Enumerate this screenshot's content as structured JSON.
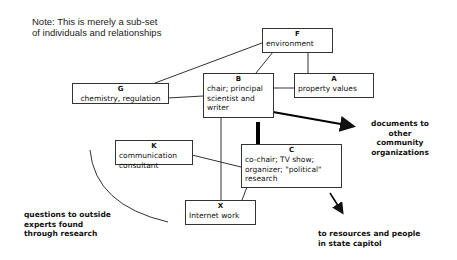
{
  "note": {
    "line1": "Note: This is merely a sub-set",
    "line2": "of individuals and relationships"
  },
  "nodes": {
    "F": {
      "id": "F",
      "lines": [
        "environment"
      ]
    },
    "G": {
      "id": "G",
      "lines": [
        "chemistry, regulation"
      ]
    },
    "B": {
      "id": "B",
      "lines": [
        "chair; principal",
        "scientist and",
        "writer"
      ]
    },
    "A": {
      "id": "A",
      "lines": [
        "property values"
      ]
    },
    "K": {
      "id": "K",
      "lines": [
        "communication",
        "consultant"
      ]
    },
    "C": {
      "id": "C",
      "lines": [
        "co-chair; TV show;",
        "organizer; \"political\"",
        "research"
      ]
    },
    "X": {
      "id": "X",
      "lines": [
        "Internet work"
      ]
    }
  },
  "external_labels": {
    "documents": [
      "documents to",
      "other",
      "community",
      "organizations"
    ],
    "state": [
      "to resources and people",
      "in state capitol"
    ],
    "questions": [
      "questions to outside",
      "experts found",
      "through research"
    ]
  },
  "edges": [
    {
      "from": "G",
      "to": "F"
    },
    {
      "from": "G",
      "to": "B"
    },
    {
      "from": "B",
      "to": "F"
    },
    {
      "from": "F",
      "to": "A"
    },
    {
      "from": "B",
      "to": "A"
    },
    {
      "from": "B",
      "to": "C",
      "style": "thick"
    },
    {
      "from": "B",
      "to": "X"
    },
    {
      "from": "K",
      "to": "C"
    },
    {
      "from": "C",
      "to": "X"
    },
    {
      "from": "B",
      "to": "documents",
      "style": "arrow"
    },
    {
      "from": "C",
      "to": "state",
      "style": "arrow"
    },
    {
      "from": "X",
      "to": "questions",
      "style": "curve"
    }
  ]
}
